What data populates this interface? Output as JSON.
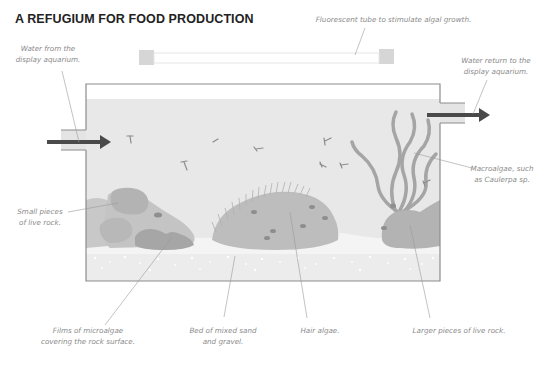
{
  "title": "A REFUGIUM FOR FOOD PRODUCTION",
  "labels": {
    "inlet": [
      "Water from the",
      "display aquarium."
    ],
    "tube": "Fluorescent tube to stimulate algal growth.",
    "outlet": [
      "Water return to the",
      "display aquarium."
    ],
    "small_rock": [
      "Small pieces",
      "of live rock."
    ],
    "macroalgae": [
      "Macroalgae, such",
      "as Caulerpa sp."
    ],
    "microalgae": [
      "Films of microalgae",
      "covering the rock surface."
    ],
    "sand": [
      "Bed of mixed sand",
      "and gravel."
    ],
    "hair_algae": "Hair algae.",
    "large_rock": "Larger pieces of live rock."
  },
  "colors": {
    "water": "#e8e8e8",
    "tank_border": "#8c8c8c",
    "arrow": "#4a4a4a",
    "rock_light": "#c2c2c2",
    "rock_mid": "#b0b0b0",
    "rock_dark": "#a3a3a3",
    "sand": "#f2f2f2",
    "macroalgae": "#9d9d9d",
    "leader_line": "#9a9a9a"
  }
}
